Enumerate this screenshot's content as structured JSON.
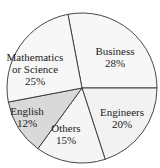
{
  "chart_data": {
    "type": "pie",
    "title": "",
    "categories": [
      "Business",
      "Engineers",
      "Others",
      "English",
      "Mathematics or Science"
    ],
    "values": [
      28,
      20,
      15,
      12,
      25
    ],
    "unit": "%",
    "labels": [
      {
        "lines": [
          "Business",
          "28%"
        ]
      },
      {
        "lines": [
          "Engineers",
          "20%"
        ]
      },
      {
        "lines": [
          "Others",
          "15%"
        ]
      },
      {
        "lines": [
          "English",
          "12%"
        ]
      },
      {
        "lines": [
          "Mathematics",
          "or Science",
          "25%"
        ]
      }
    ],
    "colors": [
      "#f7f7f7",
      "#f2f2f2",
      "#f5f5f5",
      "#d9d9d9",
      "#f7f7f7"
    ],
    "highlighted": "English",
    "start_angle_deg": 0,
    "direction": "clockwise-from-east (Business ends at east)"
  }
}
